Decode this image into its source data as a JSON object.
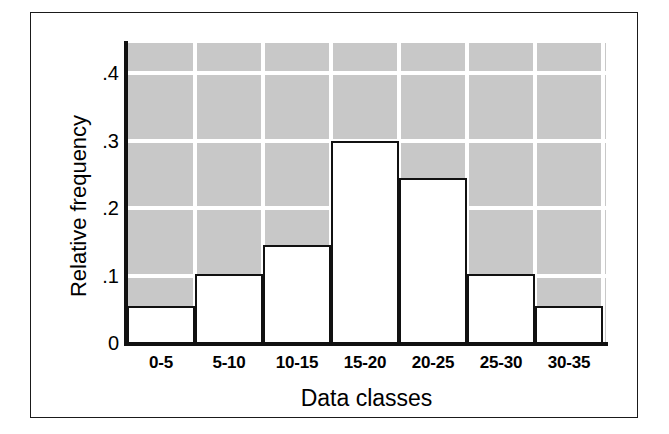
{
  "chart_data": {
    "type": "bar",
    "title": "",
    "subtitle": "",
    "xlabel": "Data classes",
    "ylabel": "Relative frequency",
    "categories": [
      "0-5",
      "5-10",
      "10-15",
      "15-20",
      "20-25",
      "25-30",
      "30-35"
    ],
    "values": [
      0.055,
      0.103,
      0.145,
      0.3,
      0.245,
      0.102,
      0.055
    ],
    "ylim": [
      0,
      0.445
    ],
    "xlim": [
      0,
      7
    ],
    "ytick_labels": [
      "0",
      ".1",
      ".2",
      ".3",
      ".4"
    ],
    "ytick_values": [
      0,
      0.1,
      0.2,
      0.3,
      0.4
    ],
    "grid": "horizontal-and-vertical",
    "grid_color": "#ffffff",
    "plot_background": "#c8c8c8",
    "bar_fill": "#ffffff",
    "bar_edge": "#111111",
    "legend": null,
    "legend_position": "none",
    "annotations": []
  },
  "figure": {
    "background": "#ffffff",
    "frame_color": "#1a1a1a"
  }
}
